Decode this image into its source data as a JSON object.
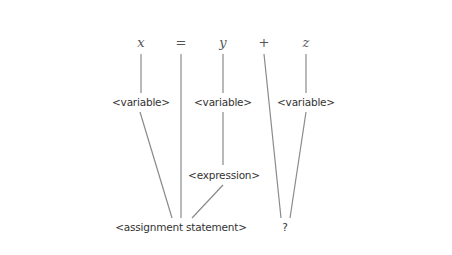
{
  "diagram": {
    "type": "parse-tree",
    "tokens": [
      {
        "id": "x",
        "text": "x",
        "x": 141,
        "y": 42,
        "kind": "variable"
      },
      {
        "id": "eq",
        "text": "=",
        "x": 181,
        "y": 42,
        "kind": "operator"
      },
      {
        "id": "y",
        "text": "y",
        "x": 223,
        "y": 42,
        "kind": "variable"
      },
      {
        "id": "plus",
        "text": "+",
        "x": 264,
        "y": 42,
        "kind": "operator"
      },
      {
        "id": "z",
        "text": "z",
        "x": 306,
        "y": 42,
        "kind": "variable"
      }
    ],
    "nodes": [
      {
        "id": "var_x",
        "text": "<variable>",
        "x": 141,
        "y": 102
      },
      {
        "id": "var_y",
        "text": "<variable>",
        "x": 223,
        "y": 102
      },
      {
        "id": "var_z",
        "text": "<variable>",
        "x": 306,
        "y": 102
      },
      {
        "id": "expr",
        "text": "<expression>",
        "x": 224,
        "y": 175
      },
      {
        "id": "assign",
        "text": "<assignment statement>",
        "x": 181,
        "y": 227
      },
      {
        "id": "unknown",
        "text": "?",
        "x": 285,
        "y": 227
      }
    ],
    "edges": [
      {
        "from": "x",
        "to": "var_x",
        "x1": 141,
        "y1": 54,
        "x2": 141,
        "y2": 93
      },
      {
        "from": "var_x",
        "to": "assign",
        "x1": 140,
        "y1": 112,
        "x2": 172,
        "y2": 218
      },
      {
        "from": "eq",
        "to": "assign",
        "x1": 181,
        "y1": 54,
        "x2": 181,
        "y2": 218
      },
      {
        "from": "y",
        "to": "var_y",
        "x1": 223,
        "y1": 54,
        "x2": 223,
        "y2": 93
      },
      {
        "from": "var_y",
        "to": "expr",
        "x1": 223,
        "y1": 112,
        "x2": 223,
        "y2": 165
      },
      {
        "from": "expr",
        "to": "assign",
        "x1": 223,
        "y1": 185,
        "x2": 192,
        "y2": 218
      },
      {
        "from": "plus",
        "to": "unknown",
        "x1": 264,
        "y1": 54,
        "x2": 281,
        "y2": 218
      },
      {
        "from": "z",
        "to": "var_z",
        "x1": 306,
        "y1": 54,
        "x2": 306,
        "y2": 93
      },
      {
        "from": "var_z",
        "to": "unknown",
        "x1": 306,
        "y1": 112,
        "x2": 290,
        "y2": 218
      }
    ],
    "colors": {
      "background": "#ffffff",
      "line": "#8a8a8a",
      "token_text": "#555555",
      "label_text": "#333333"
    }
  }
}
